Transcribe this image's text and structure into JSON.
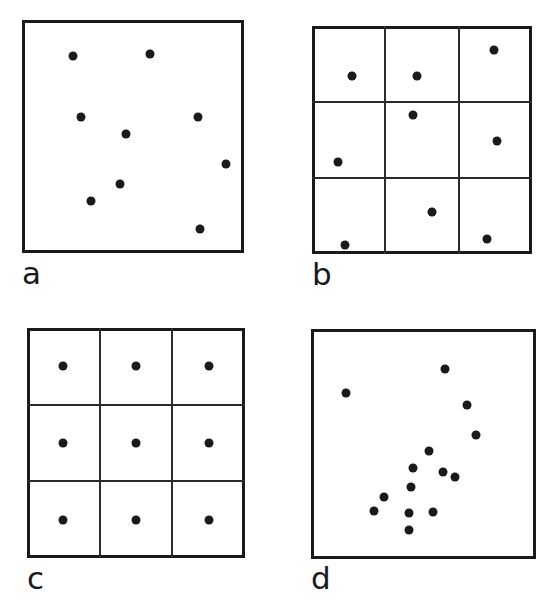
{
  "figure": {
    "width": 549,
    "height": 614,
    "background_color": "#ffffff",
    "ink_color": "#1a1a1a",
    "grid_line_color": "#2b2b2b",
    "frame_thickness": 3,
    "grid_line_thickness": 2,
    "point_diameter": 9,
    "label_font_size": 31
  },
  "chart_data": {
    "type": "scatter",
    "title": "",
    "subtitle": "",
    "xlabel": "",
    "ylabel": "",
    "xlim": [
      0,
      100
    ],
    "ylim": [
      0,
      100
    ],
    "grid": false,
    "legend": "none",
    "layout": "2x2 panel grid",
    "panels": [
      {
        "id": "a",
        "label": "a",
        "pattern": "random",
        "quadrat_grid": false,
        "grid_rows": 1,
        "grid_cols": 1,
        "n_points": 9,
        "frame": {
          "x": 22,
          "y": 20,
          "width": 222,
          "height": 233
        },
        "label_position": {
          "x": 22,
          "y": 258
        },
        "points": [
          {
            "x": 23.0,
            "y": 84.5
          },
          {
            "x": 57.5,
            "y": 85.5
          },
          {
            "x": 26.5,
            "y": 58.5
          },
          {
            "x": 79.5,
            "y": 58.5
          },
          {
            "x": 47.0,
            "y": 51.0
          },
          {
            "x": 92.0,
            "y": 38.0
          },
          {
            "x": 44.0,
            "y": 29.5
          },
          {
            "x": 31.0,
            "y": 22.5
          },
          {
            "x": 80.0,
            "y": 10.5
          }
        ]
      },
      {
        "id": "b",
        "label": "b",
        "pattern": "stratified-random",
        "quadrat_grid": true,
        "grid_rows": 3,
        "grid_cols": 3,
        "n_points": 9,
        "frame": {
          "x": 312,
          "y": 26,
          "width": 220,
          "height": 228
        },
        "label_position": {
          "x": 312,
          "y": 259
        },
        "points": [
          {
            "x": 18.0,
            "y": 78.0
          },
          {
            "x": 47.5,
            "y": 78.0
          },
          {
            "x": 82.5,
            "y": 89.5
          },
          {
            "x": 46.0,
            "y": 61.0
          },
          {
            "x": 84.0,
            "y": 49.5
          },
          {
            "x": 12.0,
            "y": 40.5
          },
          {
            "x": 54.5,
            "y": 18.5
          },
          {
            "x": 15.0,
            "y": 4.0
          },
          {
            "x": 79.5,
            "y": 6.5
          }
        ]
      },
      {
        "id": "c",
        "label": "c",
        "pattern": "regular",
        "quadrat_grid": true,
        "grid_rows": 3,
        "grid_cols": 3,
        "n_points": 9,
        "frame": {
          "x": 27,
          "y": 328,
          "width": 218,
          "height": 230
        },
        "label_position": {
          "x": 27,
          "y": 563
        },
        "points": [
          {
            "x": 16.7,
            "y": 83.3
          },
          {
            "x": 50.0,
            "y": 83.3
          },
          {
            "x": 83.3,
            "y": 83.3
          },
          {
            "x": 16.7,
            "y": 50.0
          },
          {
            "x": 50.0,
            "y": 50.0
          },
          {
            "x": 83.3,
            "y": 50.0
          },
          {
            "x": 16.7,
            "y": 16.7
          },
          {
            "x": 50.0,
            "y": 16.7
          },
          {
            "x": 83.3,
            "y": 16.7
          }
        ]
      },
      {
        "id": "d",
        "label": "d",
        "pattern": "clustered",
        "quadrat_grid": false,
        "grid_rows": 1,
        "grid_cols": 1,
        "n_points": 14,
        "frame": {
          "x": 311,
          "y": 329,
          "width": 225,
          "height": 230
        },
        "label_position": {
          "x": 311,
          "y": 563
        },
        "points": [
          {
            "x": 59.5,
            "y": 82.5
          },
          {
            "x": 15.5,
            "y": 72.0
          },
          {
            "x": 69.5,
            "y": 67.0
          },
          {
            "x": 73.5,
            "y": 54.0
          },
          {
            "x": 52.5,
            "y": 47.0
          },
          {
            "x": 45.5,
            "y": 39.5
          },
          {
            "x": 58.5,
            "y": 38.0
          },
          {
            "x": 64.0,
            "y": 35.5
          },
          {
            "x": 44.5,
            "y": 31.5
          },
          {
            "x": 32.5,
            "y": 27.0
          },
          {
            "x": 28.0,
            "y": 21.0
          },
          {
            "x": 43.5,
            "y": 20.0
          },
          {
            "x": 54.0,
            "y": 20.5
          },
          {
            "x": 43.5,
            "y": 12.5
          }
        ]
      }
    ]
  }
}
